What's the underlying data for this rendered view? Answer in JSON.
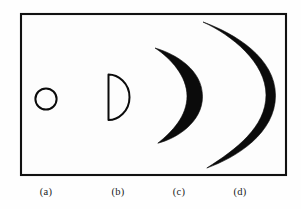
{
  "figure": {
    "background_color": "#fefefe",
    "frame_color": "#111111",
    "ink_color": "#0b0b0b",
    "frame": {
      "x": 20,
      "y": 13,
      "width": 267,
      "height": 163
    },
    "panels": [
      {
        "id": "a",
        "label": "(a)",
        "shape_name": "circle",
        "label_x": 46,
        "label_y": 195,
        "center_x": 46,
        "center_y": 99,
        "radius": 11
      },
      {
        "id": "b",
        "label": "(b)",
        "shape_name": "half-disc",
        "label_x": 118,
        "label_y": 195,
        "flat_edge_x": 107,
        "top_y": 74,
        "bottom_y": 119,
        "bulge_x": 130
      },
      {
        "id": "c",
        "label": "(c)",
        "shape_name": "thick-crescent",
        "label_x": 179,
        "label_y": 195,
        "cusp_top_x": 155,
        "cusp_top_y": 48,
        "cusp_bottom_x": 158,
        "cusp_bottom_y": 143,
        "outer_bulge_x": 203,
        "inner_bulge_x": 186
      },
      {
        "id": "d",
        "label": "(d)",
        "shape_name": "thin-crescent",
        "label_x": 240,
        "label_y": 195,
        "cusp_top_x": 203,
        "cusp_top_y": 22,
        "cusp_bottom_x": 207,
        "cusp_bottom_y": 168,
        "outer_bulge_x": 276,
        "inner_bulge_x": 266
      }
    ]
  }
}
